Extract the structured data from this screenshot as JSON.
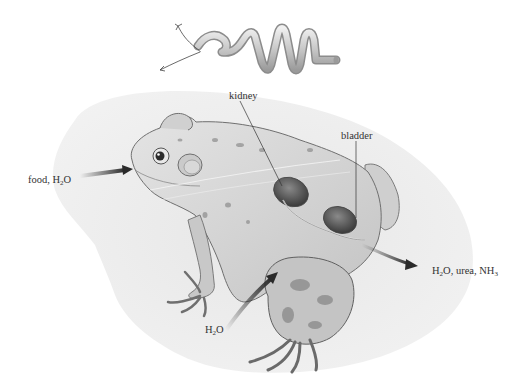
{
  "diagram": {
    "labels": {
      "intake": {
        "prefix": "food, H",
        "sub": "2",
        "suffix": "O"
      },
      "kidney": "kidney",
      "bladder": "bladder",
      "skin_intake": {
        "prefix": "H",
        "sub": "2",
        "suffix": "O"
      },
      "output": {
        "prefix": "H",
        "sub": "2",
        "mid": "O, urea, NH",
        "sub2": "3",
        "suffix": ""
      }
    },
    "inset": "nephron tubule illustration",
    "colors": {
      "text": "#333333",
      "arrow": "#2a2a2a",
      "shadow": "#e6e6e6",
      "frog_fill": "#d9d9d9",
      "frog_stroke": "#7a7a7a",
      "organ": "#5a5a5a",
      "tubule": "#cfcfcf"
    }
  }
}
